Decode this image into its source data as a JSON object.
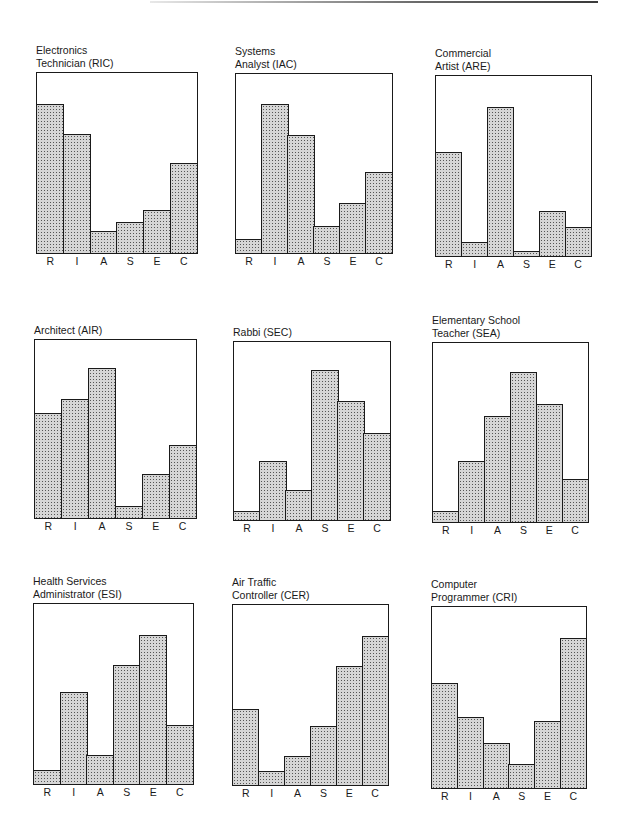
{
  "chart_data": [
    {
      "type": "bar",
      "title": "Electronics Technician (RIC)",
      "title_lines": [
        "Electronics",
        "Technician (RIC)"
      ],
      "categories": [
        "R",
        "I",
        "A",
        "S",
        "E",
        "C"
      ],
      "values": [
        0.83,
        0.66,
        0.12,
        0.17,
        0.24,
        0.5
      ],
      "xlabel": "",
      "ylabel": "",
      "ylim": [
        0,
        1
      ],
      "grid": false,
      "legend": "none"
    },
    {
      "type": "bar",
      "title": "Systems Analyst (IAC)",
      "title_lines": [
        "Systems",
        "Analyst (IAC)"
      ],
      "categories": [
        "R",
        "I",
        "A",
        "S",
        "E",
        "C"
      ],
      "values": [
        0.08,
        0.83,
        0.66,
        0.15,
        0.28,
        0.45
      ],
      "xlabel": "",
      "ylabel": "",
      "ylim": [
        0,
        1
      ],
      "grid": false,
      "legend": "none"
    },
    {
      "type": "bar",
      "title": "Commercial Artist (ARE)",
      "title_lines": [
        "Commercial",
        "Artist (ARE)"
      ],
      "categories": [
        "R",
        "I",
        "A",
        "S",
        "E",
        "C"
      ],
      "values": [
        0.58,
        0.08,
        0.83,
        0.03,
        0.25,
        0.16
      ],
      "xlabel": "",
      "ylabel": "",
      "ylim": [
        0,
        1
      ],
      "grid": false,
      "legend": "none"
    },
    {
      "type": "bar",
      "title": "Architect (AIR)",
      "title_lines": [
        "Architect (AIR)"
      ],
      "categories": [
        "R",
        "I",
        "A",
        "S",
        "E",
        "C"
      ],
      "values": [
        0.59,
        0.67,
        0.84,
        0.07,
        0.25,
        0.41
      ],
      "xlabel": "",
      "ylabel": "",
      "ylim": [
        0,
        1
      ],
      "grid": false,
      "legend": "none"
    },
    {
      "type": "bar",
      "title": "Rabbi (SEC)",
      "title_lines": [
        "Rabbi (SEC)"
      ],
      "categories": [
        "R",
        "I",
        "A",
        "S",
        "E",
        "C"
      ],
      "values": [
        0.05,
        0.33,
        0.17,
        0.84,
        0.67,
        0.49
      ],
      "xlabel": "",
      "ylabel": "",
      "ylim": [
        0,
        1
      ],
      "grid": false,
      "legend": "none"
    },
    {
      "type": "bar",
      "title": "Elementary School Teacher (SEA)",
      "title_lines": [
        "Elementary School",
        "Teacher (SEA)"
      ],
      "categories": [
        "R",
        "I",
        "A",
        "S",
        "E",
        "C"
      ],
      "values": [
        0.06,
        0.34,
        0.59,
        0.84,
        0.66,
        0.24
      ],
      "xlabel": "",
      "ylabel": "",
      "ylim": [
        0,
        1
      ],
      "grid": false,
      "legend": "none"
    },
    {
      "type": "bar",
      "title": "Health Services Administrator (ESI)",
      "title_lines": [
        "Health Services",
        "Administrator (ESI)"
      ],
      "categories": [
        "R",
        "I",
        "A",
        "S",
        "E",
        "C"
      ],
      "values": [
        0.08,
        0.51,
        0.16,
        0.66,
        0.83,
        0.33
      ],
      "xlabel": "",
      "ylabel": "",
      "ylim": [
        0,
        1
      ],
      "grid": false,
      "legend": "none"
    },
    {
      "type": "bar",
      "title": "Air Traffic Controller (CER)",
      "title_lines": [
        "Air Traffic",
        "Controller (CER)"
      ],
      "categories": [
        "R",
        "I",
        "A",
        "S",
        "E",
        "C"
      ],
      "values": [
        0.42,
        0.08,
        0.16,
        0.33,
        0.66,
        0.83
      ],
      "xlabel": "",
      "ylabel": "",
      "ylim": [
        0,
        1
      ],
      "grid": false,
      "legend": "none"
    },
    {
      "type": "bar",
      "title": "Computer Programmer (CRI)",
      "title_lines": [
        "Computer",
        "Programmer (CRI)"
      ],
      "categories": [
        "R",
        "I",
        "A",
        "S",
        "E",
        "C"
      ],
      "values": [
        0.58,
        0.39,
        0.25,
        0.13,
        0.37,
        0.83
      ],
      "xlabel": "",
      "ylabel": "",
      "ylim": [
        0,
        1
      ],
      "grid": false,
      "legend": "none"
    }
  ],
  "layout": {
    "panels": [
      {
        "left": 36,
        "top": 72,
        "width": 162,
        "height": 182
      },
      {
        "left": 235,
        "top": 73,
        "width": 158,
        "height": 181
      },
      {
        "left": 435,
        "top": 75,
        "width": 157,
        "height": 182
      },
      {
        "left": 34,
        "top": 339,
        "width": 163,
        "height": 180
      },
      {
        "left": 233,
        "top": 341,
        "width": 158,
        "height": 180
      },
      {
        "left": 432,
        "top": 342,
        "width": 157,
        "height": 181
      },
      {
        "left": 33,
        "top": 603,
        "width": 161,
        "height": 182
      },
      {
        "left": 232,
        "top": 604,
        "width": 157,
        "height": 182
      },
      {
        "left": 431,
        "top": 606,
        "width": 156,
        "height": 183
      }
    ]
  }
}
